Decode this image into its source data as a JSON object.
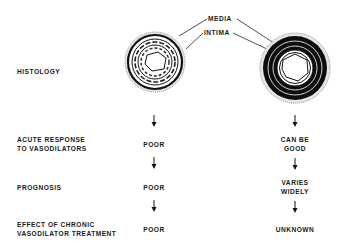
{
  "labels": {
    "media": "MEDIA",
    "intima": "INTIMA"
  },
  "rows": [
    {
      "label_lines": [
        "HISTOLOGY"
      ]
    },
    {
      "label_lines": [
        "ACUTE RESPONSE",
        "TO VASODILATORS"
      ],
      "left": [
        "POOR"
      ],
      "right": [
        "CAN BE",
        "GOOD"
      ]
    },
    {
      "label_lines": [
        "PROGNOSIS"
      ],
      "left": [
        "POOR"
      ],
      "right": [
        "VARIES",
        "WIDELY"
      ]
    },
    {
      "label_lines": [
        "EFFECT OF CHRONIC",
        "VASODILATOR TREATMENT"
      ],
      "left": [
        "POOR"
      ],
      "right": [
        "UNKNOWN"
      ]
    }
  ],
  "vessels": {
    "left": "thin-media-vessel-cross-section",
    "right": "thick-media-vessel-cross-section"
  }
}
